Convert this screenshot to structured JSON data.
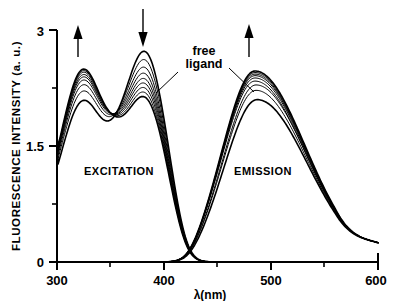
{
  "chart_data": {
    "type": "line",
    "title": "",
    "xlabel": "λ(nm)",
    "ylabel": "FLUORESCENCE INTENSITY (a. u.)",
    "xlim": [
      300,
      600
    ],
    "ylim": [
      0,
      3
    ],
    "xticks": [
      300,
      400,
      500,
      600
    ],
    "xticklabels": [
      "300",
      "400",
      "500",
      "600"
    ],
    "xticks_minor": [
      350,
      450,
      550
    ],
    "yticks": [
      0,
      1.5,
      3
    ],
    "yticklabels": [
      "0",
      "1.5",
      "3"
    ],
    "yticks_minor": [
      0.75,
      2.25
    ],
    "grid": false,
    "legend": "none",
    "line_color": "#000000",
    "series_count": 9,
    "annotations": [
      {
        "name": "excitation-region-label",
        "text": "EXCITATION",
        "x": 338,
        "y": 1.35
      },
      {
        "name": "emission-region-label",
        "text": "EMISSION",
        "x": 505,
        "y": 1.35
      },
      {
        "name": "free-ligand-label",
        "text_line1": "free",
        "text_line2": "ligand",
        "x": 432,
        "y": 2.52
      },
      {
        "name": "arrow-excitation-band1",
        "direction": "up",
        "x": 320,
        "y_from": 2.6,
        "y_to": 2.95
      },
      {
        "name": "arrow-excitation-band2",
        "direction": "down",
        "x": 381,
        "y_from": 3.15,
        "y_to": 2.85
      },
      {
        "name": "arrow-emission-band",
        "direction": "up",
        "x": 482,
        "y_from": 2.62,
        "y_to": 2.98
      }
    ],
    "series": [
      {
        "name": "titration-0-free-ligand",
        "excitation_peak1": {
          "x": 325,
          "y": 2.05
        },
        "excitation_valley": {
          "x": 352,
          "y": 1.62
        },
        "excitation_peak2": {
          "x": 383,
          "y": 2.75
        },
        "emission_peak": {
          "x": 487,
          "y": 2.1
        },
        "y_at_300": 1.47
      },
      {
        "name": "titration-1",
        "excitation_peak1": {
          "x": 325,
          "y": 2.17
        },
        "excitation_valley": {
          "x": 352,
          "y": 1.7
        },
        "excitation_peak2": {
          "x": 383,
          "y": 2.64
        },
        "emission_peak": {
          "x": 486,
          "y": 2.22
        },
        "y_at_300": 1.52
      },
      {
        "name": "titration-2",
        "excitation_peak1": {
          "x": 325,
          "y": 2.25
        },
        "excitation_valley": {
          "x": 352,
          "y": 1.74
        },
        "excitation_peak2": {
          "x": 383,
          "y": 2.54
        },
        "emission_peak": {
          "x": 486,
          "y": 2.29
        },
        "y_at_300": 1.55
      },
      {
        "name": "titration-3",
        "excitation_peak1": {
          "x": 325,
          "y": 2.31
        },
        "excitation_valley": {
          "x": 352,
          "y": 1.77
        },
        "excitation_peak2": {
          "x": 383,
          "y": 2.46
        },
        "emission_peak": {
          "x": 485,
          "y": 2.34
        },
        "y_at_300": 1.57
      },
      {
        "name": "titration-4",
        "excitation_peak1": {
          "x": 325,
          "y": 2.35
        },
        "excitation_valley": {
          "x": 352,
          "y": 1.79
        },
        "excitation_peak2": {
          "x": 383,
          "y": 2.39
        },
        "emission_peak": {
          "x": 485,
          "y": 2.38
        },
        "y_at_300": 1.58
      },
      {
        "name": "titration-5",
        "excitation_peak1": {
          "x": 325,
          "y": 2.38
        },
        "excitation_valley": {
          "x": 352,
          "y": 1.81
        },
        "excitation_peak2": {
          "x": 383,
          "y": 2.33
        },
        "emission_peak": {
          "x": 485,
          "y": 2.41
        },
        "y_at_300": 1.59
      },
      {
        "name": "titration-6",
        "excitation_peak1": {
          "x": 325,
          "y": 2.41
        },
        "excitation_valley": {
          "x": 352,
          "y": 1.83
        },
        "excitation_peak2": {
          "x": 383,
          "y": 2.27
        },
        "emission_peak": {
          "x": 485,
          "y": 2.43
        },
        "y_at_300": 1.6
      },
      {
        "name": "titration-7",
        "excitation_peak1": {
          "x": 325,
          "y": 2.43
        },
        "excitation_valley": {
          "x": 352,
          "y": 1.84
        },
        "excitation_peak2": {
          "x": 383,
          "y": 2.21
        },
        "emission_peak": {
          "x": 485,
          "y": 2.45
        },
        "y_at_300": 1.61
      },
      {
        "name": "titration-8-saturated",
        "excitation_peak1": {
          "x": 325,
          "y": 2.45
        },
        "excitation_valley": {
          "x": 352,
          "y": 1.85
        },
        "excitation_peak2": {
          "x": 383,
          "y": 2.15
        },
        "emission_peak": {
          "x": 485,
          "y": 2.47
        },
        "y_at_300": 1.62
      }
    ],
    "band_shapes": {
      "excitation_cutoff_x": 433,
      "emission_onset_x": 433,
      "emission_tail_at_600": 0.25
    }
  },
  "axis": {
    "y_title": "FLUORESCENCE INTENSITY (a. u.)",
    "x_title": "λ(nm)",
    "y_tick_0": "0",
    "y_tick_1": "1.5",
    "y_tick_2": "3",
    "x_tick_0": "300",
    "x_tick_1": "400",
    "x_tick_2": "500",
    "x_tick_3": "600"
  },
  "labels": {
    "excitation": "EXCITATION",
    "emission": "EMISSION",
    "free_ligand_l1": "free",
    "free_ligand_l2": "ligand"
  }
}
